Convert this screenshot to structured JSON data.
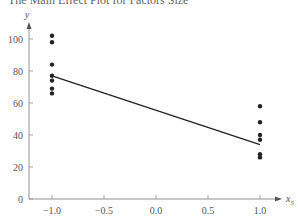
{
  "chart_data": {
    "type": "scatter",
    "title": "The Main Effect Plot for Factors Size",
    "xlabel": "x5",
    "ylabel": "y",
    "xlim": [
      -1.3,
      1.3
    ],
    "ylim": [
      0,
      110
    ],
    "xticks": [
      "-1.0",
      "-0.5",
      "0.0",
      "0.5",
      "1.0"
    ],
    "yticks": [
      "0",
      "20",
      "40",
      "60",
      "80",
      "100"
    ],
    "grid": false,
    "series": [
      {
        "name": "observations",
        "points": [
          {
            "x": -1.0,
            "y": 102
          },
          {
            "x": -1.0,
            "y": 98
          },
          {
            "x": -1.0,
            "y": 84
          },
          {
            "x": -1.0,
            "y": 77
          },
          {
            "x": -1.0,
            "y": 74
          },
          {
            "x": -1.0,
            "y": 69
          },
          {
            "x": -1.0,
            "y": 66
          },
          {
            "x": 1.0,
            "y": 58
          },
          {
            "x": 1.0,
            "y": 48
          },
          {
            "x": 1.0,
            "y": 40
          },
          {
            "x": 1.0,
            "y": 37
          },
          {
            "x": 1.0,
            "y": 28
          },
          {
            "x": 1.0,
            "y": 26
          }
        ]
      },
      {
        "name": "main effect line",
        "type": "line",
        "points": [
          {
            "x": -1.0,
            "y": 77
          },
          {
            "x": 1.0,
            "y": 34
          }
        ]
      }
    ]
  }
}
